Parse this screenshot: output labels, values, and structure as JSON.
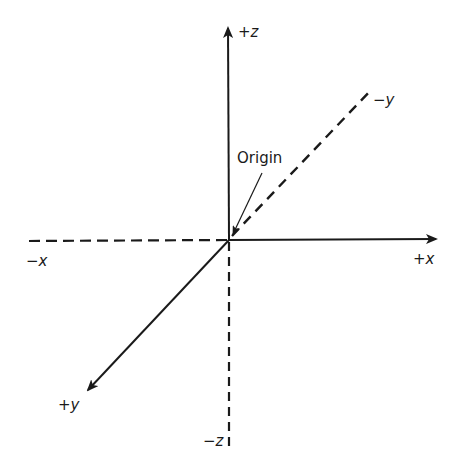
{
  "diagram": {
    "colors": {
      "line": "#1a1a1a",
      "background": "#ffffff"
    },
    "origin": {
      "label": "Origin",
      "x": 229,
      "y": 240
    },
    "axes": [
      {
        "name": "+z",
        "sign": "+",
        "var": "z",
        "style": "solid",
        "arrow": true,
        "to": [
          228,
          28
        ]
      },
      {
        "name": "-z",
        "sign": "−",
        "var": "z",
        "style": "dashed",
        "arrow": false,
        "to": [
          229,
          446
        ]
      },
      {
        "name": "+x",
        "sign": "+",
        "var": "x",
        "style": "solid",
        "arrow": true,
        "to": [
          436,
          239
        ]
      },
      {
        "name": "-x",
        "sign": "−",
        "var": "x",
        "style": "dashed",
        "arrow": false,
        "to": [
          26,
          241
        ]
      },
      {
        "name": "+y",
        "sign": "+",
        "var": "y",
        "style": "solid",
        "arrow": true,
        "to": [
          88,
          390
        ]
      },
      {
        "name": "-y",
        "sign": "−",
        "var": "y",
        "style": "dashed",
        "arrow": false,
        "to": [
          372,
          89
        ]
      }
    ]
  }
}
